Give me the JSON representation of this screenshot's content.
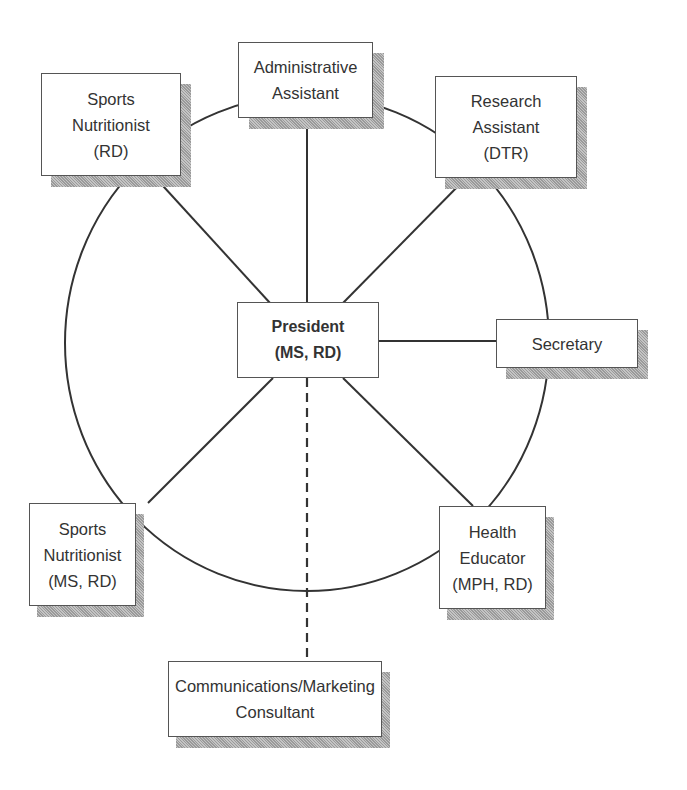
{
  "diagram": {
    "type": "organization-chart",
    "layout": "hub-and-ring",
    "center": {
      "id": "president",
      "lines": [
        "President",
        "(MS, RD)"
      ]
    },
    "ring_nodes": [
      {
        "id": "admin-assistant",
        "lines": [
          "Administrative",
          "Assistant"
        ]
      },
      {
        "id": "research-assistant",
        "lines": [
          "Research",
          "Assistant",
          "(DTR)"
        ]
      },
      {
        "id": "secretary",
        "lines": [
          "Secretary"
        ]
      },
      {
        "id": "health-educator",
        "lines": [
          "Health",
          "Educator",
          "(MPH, RD)"
        ]
      },
      {
        "id": "sports-nutritionist-ms",
        "lines": [
          "Sports",
          "Nutritionist",
          "(MS, RD)"
        ]
      },
      {
        "id": "sports-nutritionist-rd",
        "lines": [
          "Sports",
          "Nutritionist",
          "(RD)"
        ]
      }
    ],
    "external_nodes": [
      {
        "id": "comm-consultant",
        "lines": [
          "Communications/Marketing",
          "Consultant"
        ],
        "connection": "dashed"
      }
    ],
    "connections": [
      {
        "from": "president",
        "to": "admin-assistant",
        "style": "solid"
      },
      {
        "from": "president",
        "to": "research-assistant",
        "style": "solid"
      },
      {
        "from": "president",
        "to": "secretary",
        "style": "solid"
      },
      {
        "from": "president",
        "to": "health-educator",
        "style": "solid"
      },
      {
        "from": "president",
        "to": "sports-nutritionist-ms",
        "style": "solid"
      },
      {
        "from": "president",
        "to": "sports-nutritionist-rd",
        "style": "solid"
      },
      {
        "from": "president",
        "to": "comm-consultant",
        "style": "dashed"
      }
    ],
    "ring": "circle connecting all six staff boxes"
  }
}
